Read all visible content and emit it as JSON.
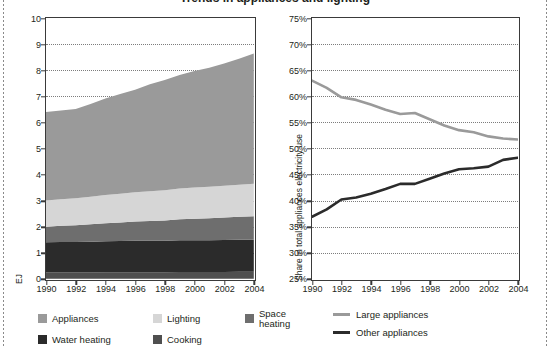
{
  "page": {
    "title_clipped": "Trends in appliances and lighting",
    "bg_color": "#ffffff"
  },
  "colors": {
    "appliances": "#9a9a9a",
    "lighting": "#d6d6d6",
    "space_heating": "#6e6e6e",
    "water_heating": "#2b2b2b",
    "cooking": "#4f4f4f",
    "large_appliances_line": "#9a9a9a",
    "other_appliances_line": "#2b2b2b",
    "axis": "#3a3a3a",
    "grid": "#7d7d7d",
    "text": "#231f20"
  },
  "left_chart": {
    "y_axis_label": "EJ",
    "y_ticks": [
      "0",
      "1",
      "2",
      "3",
      "4",
      "5",
      "6",
      "7",
      "8",
      "9",
      "10"
    ],
    "x_ticks": [
      "1990",
      "1992",
      "1994",
      "1996",
      "1998",
      "2000",
      "2002",
      "2004"
    ],
    "legend": [
      {
        "label": "Appliances",
        "color_key": "appliances"
      },
      {
        "label": "Lighting",
        "color_key": "lighting"
      },
      {
        "label": "Space heating",
        "color_key": "space_heating"
      },
      {
        "label": "Water heating",
        "color_key": "water_heating"
      },
      {
        "label": "Cooking",
        "color_key": "cooking"
      }
    ]
  },
  "right_chart": {
    "y_axis_label": "Share in total appliances electricity use",
    "y_ticks": [
      "25%",
      "30%",
      "35%",
      "40%",
      "45%",
      "50%",
      "55%",
      "60%",
      "65%",
      "70%",
      "75%"
    ],
    "x_ticks": [
      "1990",
      "1992",
      "1994",
      "1996",
      "1998",
      "2000",
      "2002",
      "2004"
    ],
    "legend": [
      {
        "label": "Large appliances",
        "color_key": "large_appliances_line"
      },
      {
        "label": "Other appliances",
        "color_key": "other_appliances_line"
      }
    ]
  },
  "chart_data": [
    {
      "type": "area",
      "id": "energy-by-end-use",
      "title": "",
      "stacked": true,
      "xlabel": "",
      "ylabel": "EJ",
      "ylim": [
        0,
        10
      ],
      "xlim": [
        1990,
        2004
      ],
      "grid": true,
      "x": [
        1990,
        1991,
        1992,
        1993,
        1994,
        1995,
        1996,
        1997,
        1998,
        1999,
        2000,
        2001,
        2002,
        2003,
        2004
      ],
      "series": [
        {
          "name": "Cooking",
          "order": 1,
          "color": "#4f4f4f",
          "values": [
            0.24,
            0.24,
            0.24,
            0.24,
            0.25,
            0.25,
            0.25,
            0.25,
            0.25,
            0.26,
            0.26,
            0.26,
            0.26,
            0.27,
            0.27
          ]
        },
        {
          "name": "Water heating",
          "order": 2,
          "color": "#2b2b2b",
          "values": [
            1.16,
            1.17,
            1.17,
            1.18,
            1.19,
            1.2,
            1.21,
            1.21,
            1.21,
            1.22,
            1.22,
            1.22,
            1.23,
            1.23,
            1.23
          ]
        },
        {
          "name": "Space heating",
          "order": 3,
          "color": "#6e6e6e",
          "values": [
            0.6,
            0.62,
            0.64,
            0.67,
            0.69,
            0.71,
            0.74,
            0.76,
            0.78,
            0.8,
            0.82,
            0.84,
            0.86,
            0.88,
            0.9
          ]
        },
        {
          "name": "Lighting",
          "order": 4,
          "color": "#d6d6d6",
          "values": [
            1.0,
            1.02,
            1.04,
            1.06,
            1.08,
            1.1,
            1.12,
            1.14,
            1.16,
            1.18,
            1.2,
            1.21,
            1.22,
            1.23,
            1.24
          ]
        },
        {
          "name": "Appliances",
          "order": 5,
          "color": "#9a9a9a",
          "values": [
            3.4,
            3.4,
            3.42,
            3.55,
            3.7,
            3.83,
            3.93,
            4.1,
            4.22,
            4.35,
            4.47,
            4.56,
            4.69,
            4.83,
            5.0
          ]
        }
      ],
      "stack_tops": [
        6.4,
        6.45,
        6.51,
        6.7,
        6.91,
        7.09,
        7.25,
        7.46,
        7.62,
        7.81,
        7.97,
        8.09,
        8.26,
        8.44,
        8.64
      ],
      "legend_position": "bottom-left"
    },
    {
      "type": "line",
      "id": "appliance-share",
      "title": "",
      "xlabel": "",
      "ylabel": "Share in total appliances electricity use",
      "ylim": [
        25,
        75
      ],
      "xlim": [
        1990,
        2004
      ],
      "grid": true,
      "y_tick_suffix": "%",
      "x": [
        1990,
        1991,
        1992,
        1993,
        1994,
        1995,
        1996,
        1997,
        1998,
        1999,
        2000,
        2001,
        2002,
        2003,
        2004
      ],
      "series": [
        {
          "name": "Large appliances",
          "color": "#9a9a9a",
          "values": [
            63.0,
            61.6,
            59.8,
            59.3,
            58.4,
            57.4,
            56.6,
            56.8,
            55.6,
            54.4,
            53.5,
            53.1,
            52.3,
            51.9,
            51.7
          ]
        },
        {
          "name": "Other appliances",
          "color": "#2b2b2b",
          "values": [
            36.9,
            38.3,
            40.2,
            40.6,
            41.3,
            42.2,
            43.2,
            43.2,
            44.2,
            45.2,
            46.0,
            46.2,
            46.5,
            47.8,
            48.2
          ]
        }
      ],
      "legend_position": "bottom-left"
    }
  ]
}
